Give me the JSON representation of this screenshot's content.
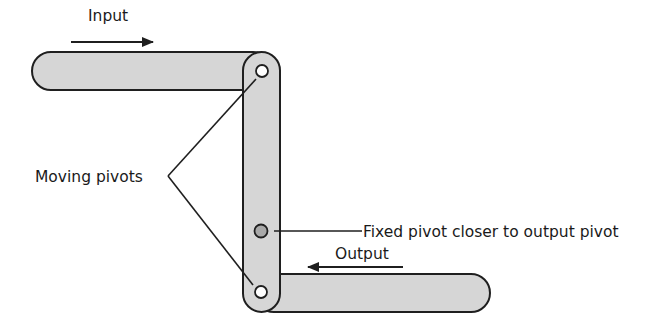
{
  "diagram": {
    "labels": {
      "input": "Input",
      "output": "Output",
      "moving_pivots": "Moving pivots",
      "fixed_pivot": "Fixed pivot closer to output pivot"
    },
    "colors": {
      "link_fill": "#d6d6d6",
      "outline": "#1f1f1f",
      "fixed_pivot_fill": "#a9a9a9",
      "moving_pivot_fill": "#ffffff",
      "text": "#1a1a1a"
    },
    "components": [
      {
        "id": "input-link",
        "type": "link",
        "orientation": "horizontal"
      },
      {
        "id": "lever-link",
        "type": "link",
        "orientation": "vertical"
      },
      {
        "id": "output-link",
        "type": "link",
        "orientation": "horizontal"
      },
      {
        "id": "top-moving-pivot",
        "type": "moving-pivot"
      },
      {
        "id": "fixed-pivot",
        "type": "fixed-pivot"
      },
      {
        "id": "bottom-moving-pivot",
        "type": "moving-pivot"
      }
    ],
    "motion": {
      "input_direction": "right",
      "output_direction": "left"
    }
  }
}
